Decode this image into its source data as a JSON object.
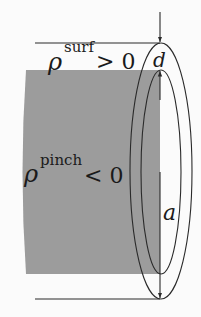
{
  "diagram": {
    "labels": {
      "rho_symbol": "ρ",
      "surf_superscript": "surf",
      "surf_relation": "> 0",
      "pinch_superscript": "pinch",
      "pinch_relation": "< 0",
      "thickness": "d",
      "radius": "a"
    },
    "colors": {
      "background": "#fbfbfb",
      "core_fill": "#9c9c9c",
      "stroke": "#2a2a2a"
    }
  }
}
